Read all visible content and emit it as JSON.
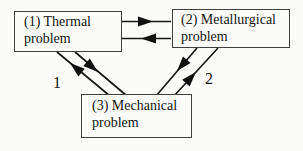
{
  "diagram": {
    "nodes": [
      {
        "id": "thermal",
        "label": "(1) Thermal\nproblem"
      },
      {
        "id": "metallurgical",
        "label": "(2) Metallurgical\nproblem"
      },
      {
        "id": "mechanical",
        "label": "(3) Mechanical\nproblem"
      }
    ],
    "edge_labels": [
      {
        "text": "1"
      },
      {
        "text": "2"
      }
    ],
    "edges": [
      {
        "from": "thermal",
        "to": "metallurgical"
      },
      {
        "from": "metallurgical",
        "to": "thermal"
      },
      {
        "from": "thermal",
        "to": "mechanical",
        "label": "1"
      },
      {
        "from": "mechanical",
        "to": "thermal",
        "label": "1"
      },
      {
        "from": "metallurgical",
        "to": "mechanical",
        "label": "2"
      },
      {
        "from": "mechanical",
        "to": "metallurgical",
        "label": "2"
      }
    ],
    "colors": {
      "line": "#181818",
      "box_border": "#3f3f3f",
      "text": "#151515",
      "background": "#fbfbf9"
    }
  }
}
